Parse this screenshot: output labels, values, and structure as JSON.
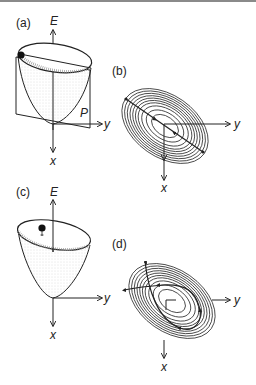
{
  "figure": {
    "panels": [
      {
        "id": "a",
        "label": "(a)",
        "axis_vertical": "E",
        "axis_right": "y",
        "axis_down": "x",
        "plane_label": "P",
        "description": "3D paraboloid energy surface with a tilted intersecting plane P; a ball sits on the rim"
      },
      {
        "id": "b",
        "label": "(b)",
        "axis_right": "y",
        "axis_down": "x",
        "description": "Elliptical contour map with a straight trajectory along the major axis"
      },
      {
        "id": "c",
        "label": "(c)",
        "axis_vertical": "E",
        "axis_right": "y",
        "axis_down": "x",
        "description": "3D paraboloid energy surface with a ball above the rim"
      },
      {
        "id": "d",
        "label": "(d)",
        "axis_right": "y",
        "axis_down": "x",
        "description": "Elliptical contour map with a curved looping trajectory"
      }
    ],
    "colors": {
      "ink": "#222222",
      "contour": "#333333",
      "top_rule": "#8a8a8a"
    }
  }
}
